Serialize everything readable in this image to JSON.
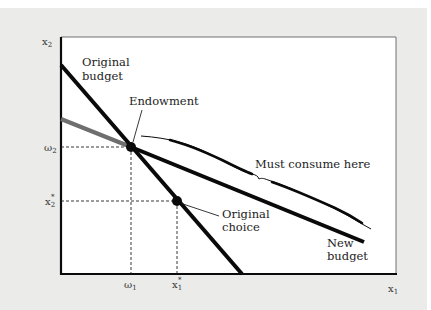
{
  "figure": {
    "axes": {
      "y_label": "x",
      "y_label_sub": "2",
      "x_label": "x",
      "x_label_sub": "1"
    },
    "ticks": {
      "y": [
        {
          "base": "ω",
          "sub": "2",
          "sup": ""
        },
        {
          "base": "x",
          "sub": "2",
          "sup": "*"
        }
      ],
      "x": [
        {
          "base": "ω",
          "sub": "1",
          "sup": ""
        },
        {
          "base": "x",
          "sub": "1",
          "sup": "*"
        }
      ]
    },
    "labels": {
      "original_budget_line1": "Original",
      "original_budget_line2": "budget",
      "endowment": "Endowment",
      "must_consume": "Must consume here",
      "original_choice_line1": "Original",
      "original_choice_line2": "choice",
      "new_budget_line1": "New",
      "new_budget_line2": "budget"
    },
    "colors": {
      "background": "#ebebea",
      "plot_area": "#ffffff",
      "lines": "#0a0a0a",
      "gray_segment": "#6e6e6e"
    }
  }
}
